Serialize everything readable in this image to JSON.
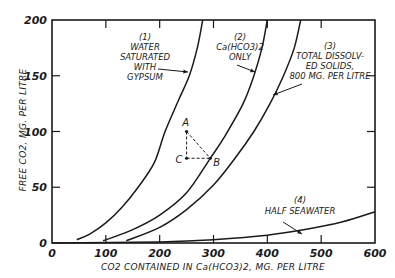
{
  "chart_data": {
    "type": "line",
    "title": "",
    "xlabel": "CO2 CONTAINED IN Ca(HCO3)2, MG. PER LITRE",
    "ylabel": "FREE CO2, MG. PER LITRE",
    "xlim": [
      0,
      600
    ],
    "ylim": [
      0,
      200
    ],
    "x_ticks": [
      "0",
      "100",
      "200",
      "300",
      "400",
      "500",
      "600"
    ],
    "y_ticks": [
      "0",
      "50",
      "100",
      "150",
      "200"
    ],
    "grid": false,
    "legend": "inline annotations",
    "series": [
      {
        "name": "(1) Water Saturated with Gypsum",
        "label_lines": [
          "(1)",
          "WATER",
          "SATURATED",
          "WITH",
          "GYPSUM"
        ],
        "points": [
          [
            46,
            3
          ],
          [
            70,
            8
          ],
          [
            100,
            18
          ],
          [
            130,
            32
          ],
          [
            160,
            50
          ],
          [
            190,
            72
          ],
          [
            210,
            100
          ],
          [
            235,
            128
          ],
          [
            255,
            150
          ],
          [
            270,
            175
          ],
          [
            280,
            200
          ]
        ]
      },
      {
        "name": "(2) Ca(HCO3)2 only",
        "label_lines": [
          "(2)",
          "Ca(HCO3)2",
          "ONLY"
        ],
        "points": [
          [
            95,
            2
          ],
          [
            150,
            12
          ],
          [
            200,
            25
          ],
          [
            250,
            45
          ],
          [
            294,
            76
          ],
          [
            320,
            95
          ],
          [
            355,
            125
          ],
          [
            375,
            150
          ],
          [
            390,
            175
          ],
          [
            400,
            200
          ]
        ]
      },
      {
        "name": "(3) Total Dissolved Solids, 800 mg. per litre",
        "label_lines": [
          "(3)",
          "TOTAL DISSOLV-",
          "ED SOLIDS,",
          "800 MG. PER LITRE"
        ],
        "points": [
          [
            138,
            2
          ],
          [
            200,
            14
          ],
          [
            250,
            30
          ],
          [
            300,
            52
          ],
          [
            340,
            76
          ],
          [
            375,
            100
          ],
          [
            405,
            125
          ],
          [
            430,
            150
          ],
          [
            450,
            175
          ],
          [
            462,
            200
          ]
        ]
      },
      {
        "name": "(4) Half Seawater",
        "label_lines": [
          "(4)",
          "HALF SEAWATER"
        ],
        "points": [
          [
            0,
            0
          ],
          [
            200,
            1
          ],
          [
            300,
            3
          ],
          [
            400,
            7
          ],
          [
            470,
            12
          ],
          [
            540,
            19
          ],
          [
            600,
            28
          ]
        ]
      }
    ],
    "annotations": [
      {
        "label": "A",
        "x": 250,
        "y": 100
      },
      {
        "label": "B",
        "x": 294,
        "y": 76
      },
      {
        "label": "C",
        "x": 250,
        "y": 76
      }
    ]
  },
  "labels": {
    "y_title": "FREE CO2, MG. PER LITRE",
    "x_title": "CO2 CONTAINED IN Ca(HCO3)2, MG. PER LITRE",
    "c1": [
      "(1)",
      "WATER",
      "SATURATED",
      "WITH",
      "GYPSUM"
    ],
    "c2": [
      "(2)",
      "Ca(HCO3)2",
      "ONLY"
    ],
    "c3": [
      "(3)",
      "TOTAL DISSOLV-",
      "ED SOLIDS,",
      "800 MG. PER LITRE"
    ],
    "c4": [
      "(4)",
      "HALF SEAWATER"
    ],
    "pA": "A",
    "pB": "B",
    "pC": "C"
  }
}
